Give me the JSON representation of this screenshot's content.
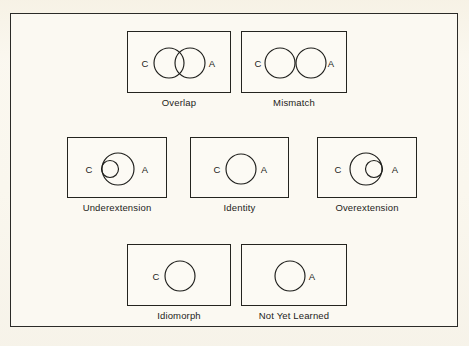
{
  "figure": {
    "legend_keys": {
      "child": "C",
      "adult": "A"
    },
    "background_color": "#faf7ee",
    "line_color": "#1e1e1b",
    "frame_color": "#2b2b28"
  },
  "rows": [
    {
      "row_index": 0,
      "panels": [
        {
          "id": "overlap",
          "caption": "Overlap",
          "left_label": "C",
          "right_label": "A",
          "relation": "partial-overlap",
          "circles": [
            {
              "name": "child",
              "cx": 41,
              "cy": 31,
              "r": 15
            },
            {
              "name": "adult",
              "cx": 62,
              "cy": 31,
              "r": 15
            }
          ],
          "left_label_x": 17,
          "right_label_x": 84,
          "label_y": 35,
          "box_width": 104,
          "box_height": 62
        },
        {
          "id": "mismatch",
          "caption": "Mismatch",
          "left_label": "C",
          "right_label": "A",
          "relation": "disjoint-tangent",
          "circles": [
            {
              "name": "child",
              "cx": 38,
              "cy": 31,
              "r": 15
            },
            {
              "name": "adult",
              "cx": 69,
              "cy": 31,
              "r": 15
            }
          ],
          "left_label_x": 16,
          "right_label_x": 89,
          "label_y": 35,
          "box_width": 106,
          "box_height": 62
        }
      ]
    },
    {
      "row_index": 1,
      "panels": [
        {
          "id": "underextension",
          "caption": "Underextension",
          "left_label": "C",
          "right_label": "A",
          "relation": "child-inside-adult",
          "circles": [
            {
              "name": "adult",
              "cx": 50,
              "cy": 31,
              "r": 16
            },
            {
              "name": "child",
              "cx": 42,
              "cy": 31,
              "r": 8.5
            }
          ],
          "left_label_x": 21,
          "right_label_x": 77,
          "label_y": 35,
          "box_width": 100,
          "box_height": 61
        },
        {
          "id": "identity",
          "caption": "Identity",
          "left_label": "C",
          "right_label": "A",
          "relation": "coincident",
          "circles": [
            {
              "name": "shared",
              "cx": 50,
              "cy": 31,
              "r": 15
            }
          ],
          "left_label_x": 26,
          "right_label_x": 73,
          "label_y": 35,
          "box_width": 99,
          "box_height": 61
        },
        {
          "id": "overextension",
          "caption": "Overextension",
          "left_label": "C",
          "right_label": "A",
          "relation": "adult-inside-child",
          "circles": [
            {
              "name": "child",
              "cx": 48,
              "cy": 31,
              "r": 16
            },
            {
              "name": "adult",
              "cx": 56,
              "cy": 31,
              "r": 8.5
            }
          ],
          "left_label_x": 20,
          "right_label_x": 77,
          "label_y": 35,
          "box_width": 100,
          "box_height": 61
        }
      ]
    },
    {
      "row_index": 2,
      "panels": [
        {
          "id": "idiomorph",
          "caption": "Idiomorph",
          "left_label": "C",
          "right_label": "",
          "relation": "child-only",
          "circles": [
            {
              "name": "child",
              "cx": 52,
              "cy": 31,
              "r": 15
            }
          ],
          "left_label_x": 28,
          "right_label_x": 0,
          "label_y": 35,
          "box_width": 104,
          "box_height": 62
        },
        {
          "id": "not-yet-learned",
          "caption": "Not Yet Learned",
          "left_label": "",
          "right_label": "A",
          "relation": "adult-only",
          "circles": [
            {
              "name": "adult",
              "cx": 48,
              "cy": 31,
              "r": 15
            }
          ],
          "left_label_x": 0,
          "right_label_x": 70,
          "label_y": 35,
          "box_width": 106,
          "box_height": 62
        }
      ]
    }
  ],
  "layout": {
    "row_tops": [
      30,
      136,
      243
    ],
    "row0_lefts": [
      126,
      240
    ],
    "row1_lefts": [
      66,
      189,
      316
    ],
    "row2_lefts": [
      126,
      240
    ]
  }
}
